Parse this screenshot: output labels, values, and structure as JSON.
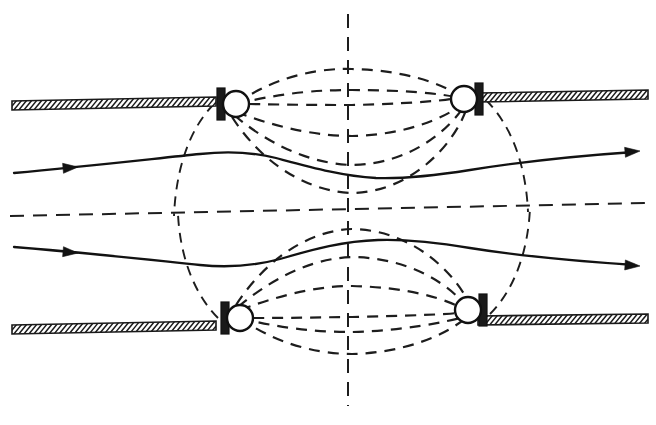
{
  "figure": {
    "type": "technical-line-diagram",
    "background_color": "#ffffff",
    "line_color": "#1a1a1a",
    "width": 656,
    "height": 425
  },
  "axes": {
    "vertical_centerline": {
      "name": "vertical-axis-of-symmetry",
      "x": 348,
      "y_top": 14,
      "y_bottom": 406,
      "style": "dashed"
    },
    "horizontal_centerline": {
      "name": "horizontal-axis-of-symmetry",
      "x_left": 10,
      "y_left": 216,
      "x_right": 648,
      "y_right": 203,
      "style": "dashed"
    }
  },
  "walls": [
    {
      "name": "upper-left-wall",
      "label": "hatched boundary wall",
      "x_start": 12,
      "y_start": 101,
      "x_end": 216,
      "y_end": 97,
      "thickness": 9,
      "hatch_count": 40
    },
    {
      "name": "upper-right-wall",
      "label": "hatched boundary wall",
      "x_start": 478,
      "y_start": 93,
      "x_end": 648,
      "y_end": 90,
      "thickness": 9,
      "hatch_count": 34
    },
    {
      "name": "lower-left-wall",
      "label": "hatched boundary wall",
      "x_start": 12,
      "y_start": 325,
      "x_end": 216,
      "y_end": 321,
      "thickness": 9,
      "hatch_count": 40
    },
    {
      "name": "lower-right-wall",
      "label": "hatched boundary wall",
      "x_start": 478,
      "y_start": 316,
      "x_end": 648,
      "y_end": 314,
      "thickness": 9,
      "hatch_count": 34
    }
  ],
  "coils": [
    {
      "name": "coil-upper-left",
      "cx": 236,
      "cy": 104,
      "r": 13,
      "step_side": "left"
    },
    {
      "name": "coil-upper-right",
      "cx": 464,
      "cy": 99,
      "r": 13,
      "step_side": "right"
    },
    {
      "name": "coil-lower-left",
      "cx": 240,
      "cy": 318,
      "r": 13,
      "step_side": "left"
    },
    {
      "name": "coil-lower-right",
      "cx": 468,
      "cy": 310,
      "r": 13,
      "step_side": "right"
    }
  ],
  "field_lines": {
    "label": "magnetic flux lines (dashed)",
    "upper_group": [
      {
        "name": "flux-upper-outer-top",
        "d": "M 236 104 C 280 72 330 68 352 69 C 400 70 442 82 464 99"
      },
      {
        "name": "flux-upper-mid-top",
        "d": "M 236 104 C 286 92 320 90 352 90 C 400 90 442 93 464 99"
      },
      {
        "name": "flux-upper-straight",
        "d": "M 249 104 C 300 105 330 105 352 105 C 400 104 440 101 451 99"
      },
      {
        "name": "flux-upper-mid-low",
        "d": "M 236 112 C 284 130 322 136 352 136 C 404 135 444 119 464 103"
      },
      {
        "name": "flux-upper-low",
        "d": "M 234 115 C 278 152 320 164 352 165 C 410 164 450 130 466 103"
      },
      {
        "name": "flux-upper-lowest",
        "d": "M 232 117 C 268 172 316 192 352 193 C 414 192 458 140 468 104"
      }
    ],
    "upper_outer_arcs": [
      {
        "name": "flux-upper-left-outer-arc",
        "d": "M 214 104 C 190 128 176 168 174 216"
      },
      {
        "name": "flux-upper-right-outer-arc",
        "d": "M 486 100 C 512 126 526 166 528 212"
      }
    ],
    "lower_group": [
      {
        "name": "flux-lower-outer-bottom",
        "d": "M 240 318 C 284 350 332 354 352 354 C 402 353 446 336 468 316"
      },
      {
        "name": "flux-lower-mid-bottom",
        "d": "M 240 318 C 288 330 322 332 352 332 C 402 331 446 322 468 316"
      },
      {
        "name": "flux-lower-straight",
        "d": "M 253 318 C 302 318 330 317 352 317 C 402 316 456 314 455 313"
      },
      {
        "name": "flux-lower-mid-high",
        "d": "M 240 310 C 288 292 324 286 352 286 C 404 287 448 298 468 312"
      },
      {
        "name": "flux-lower-high",
        "d": "M 238 307 C 282 270 322 258 352 257 C 412 258 452 286 470 311"
      },
      {
        "name": "flux-lower-highest",
        "d": "M 236 305 C 272 250 318 230 352 229 C 416 230 460 278 472 310"
      }
    ],
    "lower_outer_arcs": [
      {
        "name": "flux-lower-left-outer-arc",
        "d": "M 218 318 C 194 294 180 256 178 214"
      },
      {
        "name": "flux-lower-right-outer-arc",
        "d": "M 490 314 C 514 290 528 252 530 208"
      }
    ]
  },
  "trajectories": [
    {
      "name": "upper-particle-trajectory",
      "label": "upper beam path",
      "d": "M 14 173 C 90 166 160 158 200 154 C 228 151 252 152 276 158 C 310 167 342 176 376 178 C 404 179 432 176 470 170 C 520 162 590 155 634 152",
      "arrow_mid": {
        "x": 78,
        "y": 167,
        "angle": -5
      },
      "arrow_end": {
        "x": 640,
        "y": 151,
        "angle": -5
      }
    },
    {
      "name": "lower-particle-trajectory",
      "label": "lower beam path",
      "d": "M 14 247 C 90 253 160 261 200 265 C 230 268 254 266 280 259 C 314 249 344 241 378 240 C 406 239 434 242 470 248 C 520 256 590 262 634 265",
      "arrow_mid": {
        "x": 78,
        "y": 253,
        "angle": 5
      },
      "arrow_end": {
        "x": 640,
        "y": 266,
        "angle": 4
      }
    }
  ]
}
